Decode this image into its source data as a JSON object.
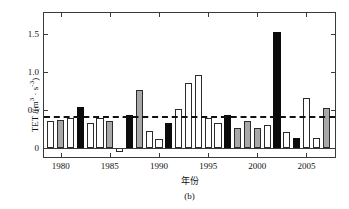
{
  "chart_data": {
    "type": "bar",
    "title": "",
    "subtitle": "",
    "caption": "(b)",
    "xlabel": "年份",
    "ylabel": "TET /(m³ · s⁻³)",
    "ylabel_parts": {
      "name": "TET /(m",
      "sup1": "3",
      "middot": " · s",
      "sup2": "-3",
      "close": ")"
    },
    "xlim": [
      1978.3,
      2007.9
    ],
    "ylim": [
      -0.12,
      1.78
    ],
    "ytick_labels": [
      "0",
      "0.5",
      "1.0",
      "1.5"
    ],
    "ytick_values": [
      0,
      0.5,
      1.0,
      1.5
    ],
    "xtick_labels": [
      "1980",
      "1985",
      "1990",
      "1995",
      "2000",
      "2005"
    ],
    "xtick_values": [
      1980,
      1985,
      1990,
      1995,
      2000,
      2005
    ],
    "grid": false,
    "legend": "none",
    "reference_line": {
      "label": "mean",
      "value": 0.42,
      "style": "dashed",
      "color": "#111111"
    },
    "colors": {
      "white": "#ffffff",
      "gray": "#a8a8a8",
      "black": "#0b0b0b",
      "axis": "#3a3a3a"
    },
    "categories": [
      1979,
      1980,
      1981,
      1982,
      1983,
      1984,
      1985,
      1986,
      1987,
      1988,
      1989,
      1990,
      1991,
      1992,
      1993,
      1994,
      1995,
      1996,
      1997,
      1998,
      1999,
      2000,
      2001,
      2002,
      2003,
      2004,
      2005,
      2006,
      2007
    ],
    "values": [
      0.36,
      0.37,
      0.39,
      0.54,
      0.33,
      0.4,
      0.35,
      -0.05,
      0.44,
      0.76,
      0.22,
      0.12,
      0.33,
      0.51,
      0.86,
      0.96,
      0.39,
      0.33,
      0.43,
      0.26,
      0.36,
      0.26,
      0.3,
      1.53,
      0.21,
      0.13,
      0.66,
      0.13,
      0.52
    ],
    "bar_styles": [
      "white",
      "gray",
      "white",
      "black",
      "white",
      "white",
      "gray",
      "white",
      "black",
      "gray",
      "white",
      "white",
      "black",
      "white",
      "white",
      "white",
      "white",
      "white",
      "black",
      "gray",
      "gray",
      "gray",
      "white",
      "black",
      "white",
      "black",
      "white",
      "white",
      "gray"
    ],
    "series": [
      {
        "name": "TET",
        "values": [
          0.36,
          0.37,
          0.39,
          0.54,
          0.33,
          0.4,
          0.35,
          -0.05,
          0.44,
          0.76,
          0.22,
          0.12,
          0.33,
          0.51,
          0.86,
          0.96,
          0.39,
          0.33,
          0.43,
          0.26,
          0.36,
          0.26,
          0.3,
          1.53,
          0.21,
          0.13,
          0.66,
          0.13,
          0.52
        ]
      }
    ]
  }
}
